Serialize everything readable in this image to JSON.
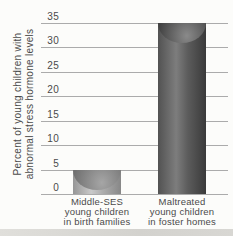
{
  "figure": {
    "background": "#fcfcfa",
    "gridline_color": "#ababab",
    "text_color": "#4a4a4a",
    "bottom_strip_color": "#d6d5d1"
  },
  "chart_data": {
    "type": "bar",
    "title": "",
    "xlabel": "",
    "ylabel": "Percent of young children with abnormal stress hormone levels",
    "ylabel_lines": [
      "Percent of young children with",
      "abnormal stress hormone levels"
    ],
    "categories": [
      "Middle-SES young children in birth families",
      "Maltreated young children in foster homes"
    ],
    "category_lines": [
      [
        "Middle-SES",
        "young children",
        "in birth families"
      ],
      [
        "Maltreated",
        "young children",
        "in foster homes"
      ]
    ],
    "values": [
      5,
      35
    ],
    "ylim": [
      0,
      35
    ],
    "ytick_step": 5,
    "ytick_labels": [
      "35",
      "30",
      "25",
      "20",
      "15",
      "10",
      "5",
      "0"
    ],
    "grid": true,
    "legend": null,
    "bar_style": "3d-cylinder",
    "bar_colors": [
      {
        "name": "middle-ses-bar",
        "edge_left": "#969696",
        "highlight": "#c9c9c9",
        "mid": "#adadad",
        "edge_right": "#878787",
        "cap_light": "#a6a6a6",
        "cap_dark": "#6f6f6f"
      },
      {
        "name": "maltreated-bar",
        "edge_left": "#525252",
        "highlight": "#7d7d7d",
        "mid": "#5c5c5c",
        "edge_right": "#3a3a3a",
        "cap_light": "#8a8a8a",
        "cap_dark": "#404040"
      }
    ]
  }
}
